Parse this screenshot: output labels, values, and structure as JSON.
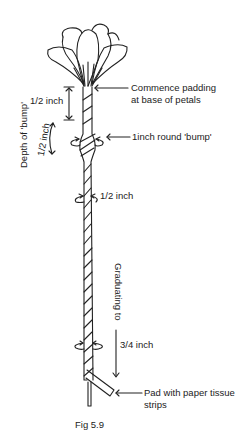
{
  "figure": {
    "caption": "Fig 5.9",
    "labels": {
      "commence_line1": "Commence padding",
      "commence_line2": "at base of petals",
      "half_inch_top": "1/2 inch",
      "depth_of_bump": "Depth of 'bump'",
      "depth_half_inch": "1/2 inch",
      "bump": "1inch round 'bump'",
      "half_inch_round": "1/2 inch",
      "graduating": "Graduating to",
      "three_quarter": "3/4 inch",
      "pad_line1": "Pad with paper tissue",
      "pad_line2": "strips"
    },
    "colors": {
      "ink": "#222222",
      "background": "#ffffff"
    }
  }
}
